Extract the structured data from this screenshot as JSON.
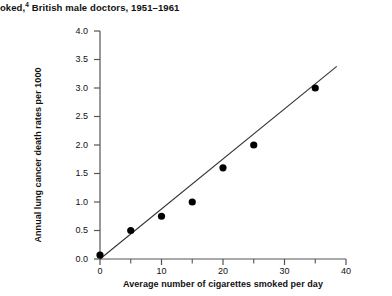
{
  "title": {
    "text_before_sup": "noked,",
    "sup": "4",
    "text_after_sup": " British male doctors, 1951–1961",
    "full": "noked,4 British male doctors, 1951–1961"
  },
  "chart_data": {
    "type": "scatter",
    "title": "noked,4 British male doctors, 1951–1961",
    "xlabel": "Average number of cigarettes smoked per day",
    "ylabel": "Annual lung cancer death rates per 1000",
    "xlim": [
      0,
      40
    ],
    "ylim": [
      0,
      4.0
    ],
    "grid": false,
    "legend": "none",
    "x": [
      0,
      5,
      10,
      15,
      20,
      25,
      35
    ],
    "y": [
      0.07,
      0.5,
      0.75,
      1.0,
      1.6,
      2.0,
      3.0
    ],
    "points": [
      {
        "x": 0,
        "y": 0.07
      },
      {
        "x": 5,
        "y": 0.5
      },
      {
        "x": 10,
        "y": 0.75
      },
      {
        "x": 15,
        "y": 1.0
      },
      {
        "x": 20,
        "y": 1.6
      },
      {
        "x": 25,
        "y": 2.0
      },
      {
        "x": 35,
        "y": 3.0
      }
    ],
    "fit_line": {
      "name": "regression-line",
      "x_start": 0.0,
      "y_start": 0.0,
      "x_end": 38.5,
      "y_end": 3.38
    },
    "xticks": [
      0,
      10,
      20,
      30,
      40
    ],
    "xtick_labels": [
      "0",
      "10",
      "20",
      "30",
      "40"
    ],
    "xminor_ticks": [
      5,
      15,
      25,
      35
    ],
    "yticks": [
      0.0,
      0.5,
      1.0,
      1.5,
      2.0,
      2.5,
      3.0,
      3.5,
      4.0
    ],
    "ytick_labels": [
      "0.0",
      "0.5",
      "1.0",
      "1.5",
      "2.0",
      "2.5",
      "3.0",
      "3.5",
      "4.0"
    ],
    "marker_color": "#000000",
    "line_color": "#333333",
    "axis_color": "#555555"
  }
}
